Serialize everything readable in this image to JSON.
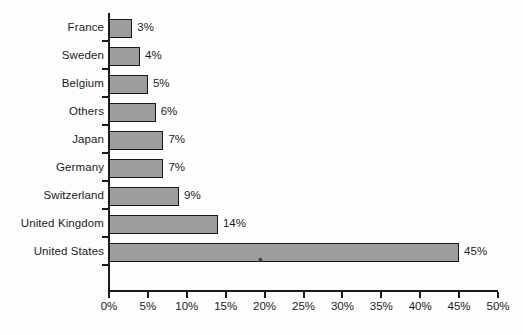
{
  "chart_data": {
    "type": "bar",
    "orientation": "horizontal",
    "title": "",
    "subtitle": "",
    "xlabel": "",
    "ylabel": "",
    "categories": [
      "France",
      "Sweden",
      "Belgium",
      "Others",
      "Japan",
      "Germany",
      "Switzerland",
      "United Kingdom",
      "United States"
    ],
    "values": [
      3,
      4,
      5,
      6,
      7,
      7,
      9,
      14,
      45
    ],
    "data_labels": [
      "3%",
      "4%",
      "5%",
      "6%",
      "7%",
      "7%",
      "9%",
      "14%",
      "45%"
    ],
    "xlim": [
      0,
      50
    ],
    "xticks": [
      0,
      5,
      10,
      15,
      20,
      25,
      30,
      35,
      40,
      45,
      50
    ],
    "xtick_labels": [
      "0%",
      "5%",
      "10%",
      "15%",
      "20%",
      "25%",
      "30%",
      "35%",
      "40%",
      "45%",
      "50%"
    ],
    "grid": false,
    "legend": null,
    "bar_fill_color": "#9d9d9d",
    "bar_border_color": "#1a1a1a",
    "axis_color": "#1a1a1a",
    "background_color": "#fdfdfd",
    "units": "percent"
  }
}
